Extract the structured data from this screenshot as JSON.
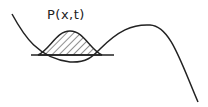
{
  "diagram": {
    "label": "P(x,t)",
    "elements": [
      {
        "name": "potential-curve",
        "description": "Potential energy curve with a local well and a barrier"
      },
      {
        "name": "baseline",
        "description": "Horizontal reference line at the bottom of the well"
      },
      {
        "name": "probability-distribution",
        "description": "Hatched bell-shaped distribution P(x,t) localized in the well"
      }
    ],
    "colors": {
      "stroke": "#222222",
      "background": "#ffffff"
    }
  }
}
